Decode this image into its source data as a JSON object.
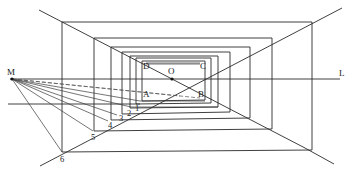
{
  "diagram": {
    "type": "one-point perspective construction (corridor / nested frames)",
    "labels": {
      "M": "M",
      "O": "O",
      "L": "L",
      "A": "A",
      "B": "B",
      "C": "C",
      "D": "D",
      "n1": "1",
      "n2": "2",
      "n3": "3",
      "n4": "4",
      "n5": "5",
      "n6": "6"
    },
    "points": {
      "M": [
        12,
        79
      ],
      "O": [
        172,
        79
      ],
      "A": [
        142,
        99
      ],
      "B": [
        204,
        99
      ],
      "C": [
        204,
        62
      ],
      "D": [
        142,
        62
      ],
      "p1": [
        140,
        101
      ],
      "p2": [
        131,
        107
      ],
      "p3": [
        117,
        115
      ],
      "p4": [
        108,
        121
      ],
      "p5": [
        93,
        131
      ],
      "p6": [
        62,
        152
      ]
    },
    "colors": {
      "line": "#2a2a2a",
      "background": "#ffffff"
    }
  }
}
